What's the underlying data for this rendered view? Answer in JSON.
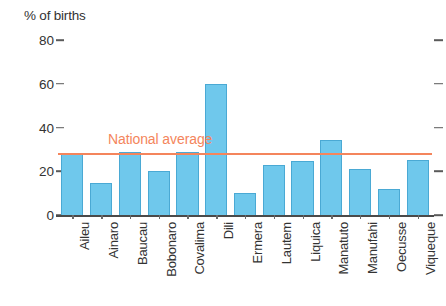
{
  "chart_data": {
    "type": "bar",
    "title": "% of births",
    "xlabel": "",
    "ylabel": "% of births",
    "ylim": [
      0,
      80
    ],
    "yticks": [
      0,
      20,
      40,
      60,
      80
    ],
    "grid": false,
    "legend": "none",
    "categories": [
      "Aileu",
      "Ainaro",
      "Baucau",
      "Bobonaro",
      "Covalima",
      "Dili",
      "Ermera",
      "Lautem",
      "Liquica",
      "Manatuto",
      "Manufahi",
      "Oecusse",
      "Viqueque"
    ],
    "values": [
      28,
      14.5,
      29,
      20,
      29,
      60,
      10,
      23,
      24.5,
      34.5,
      21,
      12,
      25
    ],
    "series": [
      {
        "name": "% of births",
        "values": [
          28,
          14.5,
          29,
          20,
          29,
          60,
          10,
          23,
          24.5,
          34.5,
          21,
          12,
          25
        ]
      }
    ],
    "annotations": [
      {
        "type": "hline",
        "label": "National average",
        "value": 28.5,
        "color": "#F4855C"
      }
    ],
    "colors": {
      "bar_fill": "#6FC8EC",
      "bar_stroke": "#4aa9d4",
      "average_line": "#F4855C",
      "axis": "#4a4a4a",
      "text": "#333333"
    }
  }
}
